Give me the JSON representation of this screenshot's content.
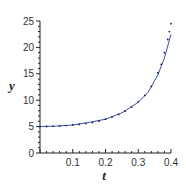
{
  "chart_data": {
    "type": "line",
    "title": "",
    "xlabel": "t",
    "ylabel": "y",
    "xlim": [
      0,
      0.4
    ],
    "ylim": [
      0,
      25
    ],
    "grid": false,
    "legend": "none",
    "x_ticks": [
      "0",
      "0.1",
      "0.2",
      "0.3",
      "0.4"
    ],
    "x_tick_values": [
      0,
      0.1,
      0.2,
      0.3,
      0.4
    ],
    "y_ticks": [
      "0",
      "5",
      "10",
      "15",
      "20",
      "25"
    ],
    "y_tick_values": [
      0,
      5,
      10,
      15,
      20,
      25
    ],
    "series": [
      {
        "name": "exact solution",
        "style": "solid",
        "color": "#3a4fb0",
        "x": [
          0,
          0.05,
          0.1,
          0.15,
          0.2,
          0.25,
          0.3,
          0.33,
          0.36,
          0.38,
          0.4
        ],
        "y": [
          5.0,
          5.1,
          5.3,
          5.8,
          6.4,
          7.6,
          9.6,
          11.5,
          14.8,
          18.0,
          22.5
        ]
      },
      {
        "name": "numerical approximation",
        "style": "points",
        "color": "#1a1f4a",
        "x": [
          0,
          0.02,
          0.04,
          0.06,
          0.08,
          0.1,
          0.12,
          0.14,
          0.16,
          0.18,
          0.2,
          0.22,
          0.24,
          0.26,
          0.28,
          0.3,
          0.32,
          0.34,
          0.36,
          0.37,
          0.38,
          0.39,
          0.395,
          0.4
        ],
        "y": [
          5.0,
          5.02,
          5.06,
          5.12,
          5.2,
          5.3,
          5.42,
          5.58,
          5.78,
          6.02,
          6.4,
          6.8,
          7.3,
          7.95,
          8.7,
          9.7,
          10.9,
          12.6,
          15.2,
          16.8,
          19.0,
          21.5,
          23.0,
          24.5
        ]
      }
    ]
  }
}
